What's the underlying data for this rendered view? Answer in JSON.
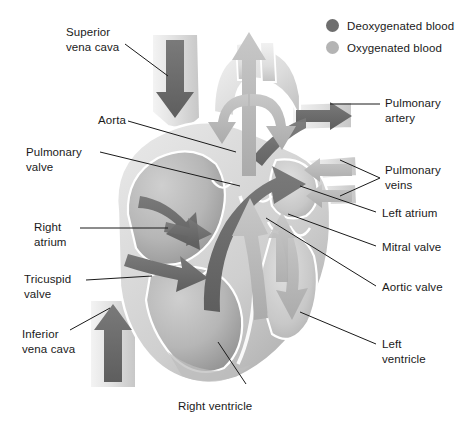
{
  "figure": {
    "background_color": "#ffffff",
    "text_color": "#1a1a1a",
    "leader_line_color": "#1a1a1a"
  },
  "legend": {
    "items": [
      {
        "label": "Deoxygenated blood",
        "color": "#6e6e6e",
        "icon": "filled-circle"
      },
      {
        "label": "Oxygenated blood",
        "color": "#b4b4b4",
        "icon": "filled-circle"
      }
    ]
  },
  "labels": {
    "superior_vena_cava": "Superior\nvena cava",
    "aorta": "Aorta",
    "pulmonary_valve": "Pulmonary\nvalve",
    "right_atrium": "Right\natrium",
    "tricuspid_valve": "Tricuspid\nvalve",
    "inferior_vena_cava": "Inferior\nvena cava",
    "right_ventricle": "Right ventricle",
    "pulmonary_artery": "Pulmonary\nartery",
    "pulmonary_veins": "Pulmonary\nveins",
    "left_atrium": "Left atrium",
    "mitral_valve": "Mitral valve",
    "aortic_valve": "Aortic valve",
    "left_ventricle": "Left\nventricle"
  },
  "colors": {
    "deoxygenated_arrow": "#6e6e6e",
    "oxygenated_arrow": "#bdbdbd",
    "muscle_light": "#e9e9e9",
    "muscle_mid": "#d2d2d2",
    "muscle_dark": "#b0b0b0",
    "chamber_shadow": "#9a9a9a",
    "vessel_fill": "#e4e4e4",
    "outline": "#ffffff"
  }
}
